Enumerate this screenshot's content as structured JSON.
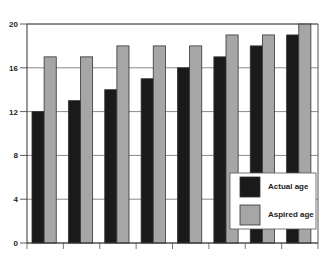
{
  "chart_data": {
    "type": "bar",
    "title": "",
    "xlabel": "",
    "ylabel": "",
    "categories": [
      "1",
      "2",
      "3",
      "4",
      "5",
      "6",
      "7",
      "8"
    ],
    "series": [
      {
        "name": "Actual age",
        "color": "#1a1a1a",
        "values": [
          12,
          13,
          14,
          15,
          16,
          17,
          18,
          19
        ]
      },
      {
        "name": "Aspired age",
        "color": "#a6a6a6",
        "values": [
          17,
          17,
          18,
          18,
          18,
          19,
          19,
          20
        ]
      }
    ],
    "ylim": [
      0,
      20
    ],
    "yticks": [
      "0",
      "4",
      "8",
      "12",
      "16",
      "20"
    ],
    "grid": true,
    "legend_position": "lower right, inside plot"
  },
  "legend": {
    "items": [
      {
        "label": "Actual age"
      },
      {
        "label": "Aspired age"
      }
    ]
  }
}
